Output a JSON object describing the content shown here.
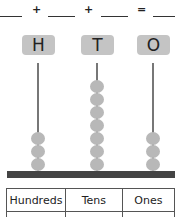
{
  "equation": {
    "operators": [
      "+",
      "+",
      "="
    ],
    "blanks": [
      "",
      "",
      "",
      ""
    ]
  },
  "columns": [
    {
      "letter": "H",
      "name": "Hundreds",
      "beads": 3,
      "value": ""
    },
    {
      "letter": "T",
      "name": "Tens",
      "beads": 7,
      "value": ""
    },
    {
      "letter": "O",
      "name": "Ones",
      "beads": 3,
      "value": ""
    }
  ],
  "colors": {
    "label_box": "#c4c4c4",
    "bead": "#b8b8b8",
    "rod": "#777777",
    "base": "#444444"
  }
}
